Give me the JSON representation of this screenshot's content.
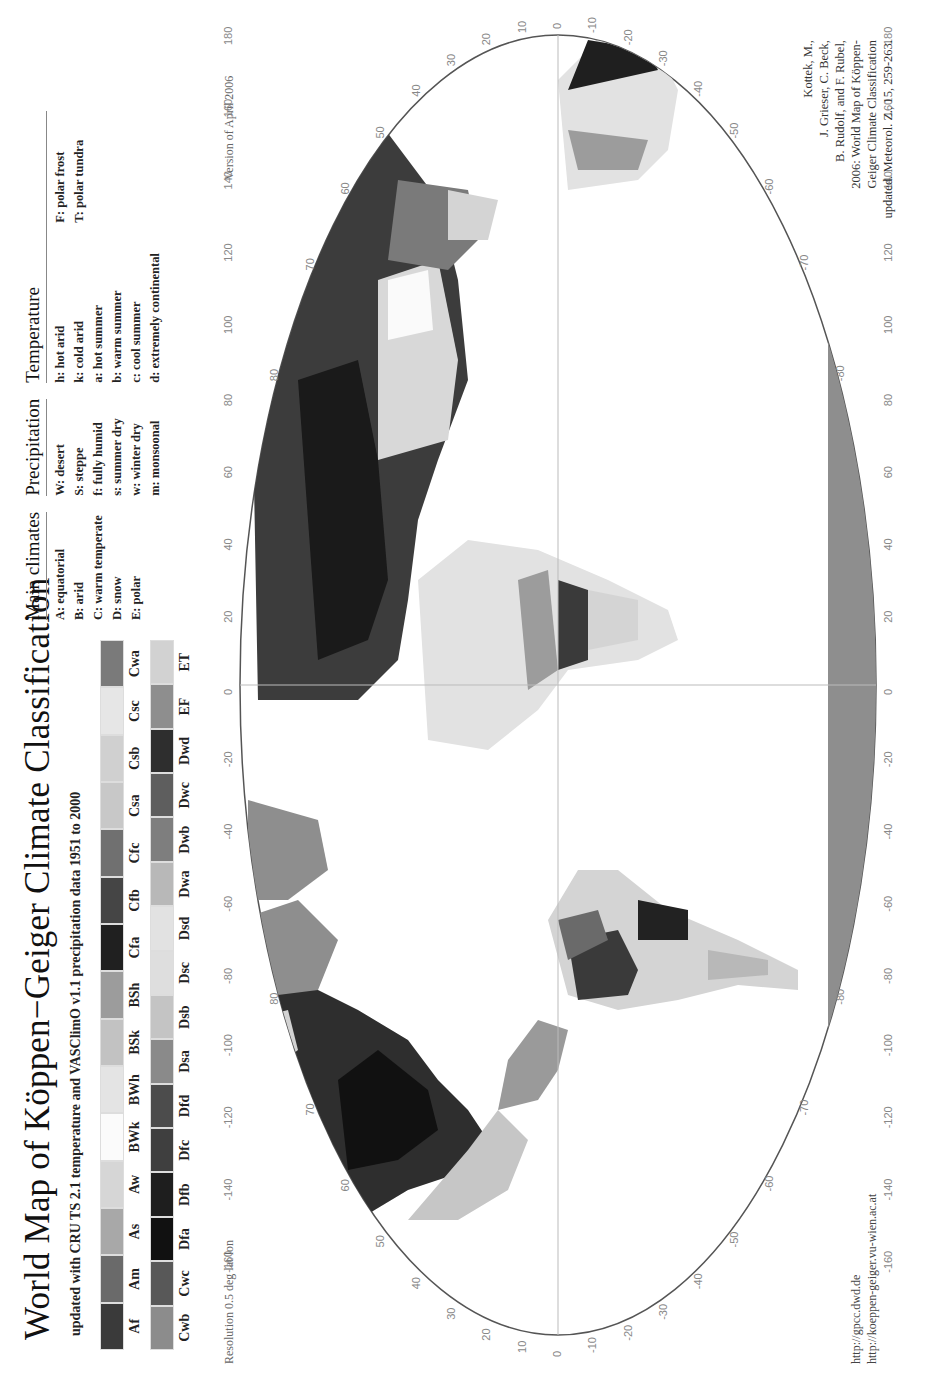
{
  "header": {
    "title": "World Map of Köppen−Geiger Climate Classification",
    "subtitle": "updated with CRU TS 2.1 temperature and VASClimO v1.1 precipitation data 1951 to 2000"
  },
  "legend": {
    "row1": [
      {
        "code": "Af",
        "color": "#3a3a3a"
      },
      {
        "code": "Am",
        "color": "#6a6a6a"
      },
      {
        "code": "As",
        "color": "#a8a8a8"
      },
      {
        "code": "Aw",
        "color": "#d6d6d6"
      },
      {
        "code": "BWk",
        "color": "#fbfbfb"
      },
      {
        "code": "BWh",
        "color": "#e4e4e4"
      },
      {
        "code": "BSk",
        "color": "#c2c2c2"
      },
      {
        "code": "BSh",
        "color": "#9c9c9c"
      },
      {
        "code": "Cfa",
        "color": "#202020"
      },
      {
        "code": "Cfb",
        "color": "#454545"
      },
      {
        "code": "Cfc",
        "color": "#707070"
      },
      {
        "code": "Csa",
        "color": "#c8c8c8"
      },
      {
        "code": "Csb",
        "color": "#d0d0d0"
      },
      {
        "code": "Csc",
        "color": "#e6e6e6"
      },
      {
        "code": "Cwa",
        "color": "#7a7a7a"
      }
    ],
    "row2": [
      {
        "code": "Cwb",
        "color": "#8c8c8c"
      },
      {
        "code": "Cwc",
        "color": "#585858"
      },
      {
        "code": "Dfa",
        "color": "#111111"
      },
      {
        "code": "Dfb",
        "color": "#1e1e1e"
      },
      {
        "code": "Dfc",
        "color": "#3f3f3f"
      },
      {
        "code": "Dfd",
        "color": "#4c4c4c"
      },
      {
        "code": "Dsa",
        "color": "#8a8a8a"
      },
      {
        "code": "Dsb",
        "color": "#c4c4c4"
      },
      {
        "code": "Dsc",
        "color": "#dedede"
      },
      {
        "code": "Dsd",
        "color": "#e2e2e2"
      },
      {
        "code": "Dwa",
        "color": "#b8b8b8"
      },
      {
        "code": "Dwb",
        "color": "#7e7e7e"
      },
      {
        "code": "Dwc",
        "color": "#5e5e5e"
      },
      {
        "code": "Dwd",
        "color": "#2e2e2e"
      },
      {
        "code": "EF",
        "color": "#8e8e8e"
      },
      {
        "code": "ET",
        "color": "#d2d2d2"
      }
    ]
  },
  "definitions": {
    "main": {
      "heading": "Main climates",
      "items": [
        "A: equatorial",
        "B: arid",
        "C: warm temperate",
        "D: snow",
        "E: polar"
      ]
    },
    "precipitation": {
      "heading": "Precipitation",
      "items": [
        "W: desert",
        "S: steppe",
        "f: fully humid",
        "s: summer dry",
        "w: winter dry",
        "m: monsoonal"
      ]
    },
    "temperature": {
      "heading": "Temperature",
      "items": [
        "h: hot arid",
        "k: cold arid",
        "a: hot summer",
        "b: warm summer",
        "c: cool summer",
        "d: extremely continental"
      ],
      "extra": [
        "F: polar frost",
        "T: polar tundra"
      ]
    }
  },
  "map": {
    "version": "Version of April 2006",
    "resolution": "Resolution  0.5 deg lat/lon",
    "lon_ticks": [
      "-160",
      "-140",
      "-120",
      "-100",
      "-80",
      "-60",
      "-40",
      "-20",
      "0",
      "20",
      "40",
      "60",
      "80",
      "100",
      "120",
      "140",
      "160",
      "180"
    ],
    "lat_ticks": [
      "80",
      "70",
      "60",
      "50",
      "40",
      "30",
      "20",
      "10",
      "0",
      "-10",
      "-20",
      "-30",
      "-40",
      "-50",
      "-60",
      "-70",
      "-80"
    ],
    "edge_labels": {
      "left_top": "90",
      "left_bottom": "-90"
    },
    "region_labels": [
      "EF",
      "ET",
      "Dfc",
      "Dfb",
      "Dfa",
      "Cfa",
      "BSk",
      "BWh",
      "Csb",
      "Cfb",
      "Am",
      "Af",
      "Aw",
      "Cfa",
      "BWk",
      "BSh",
      "Csa",
      "Dwc",
      "Dwb",
      "Dfd",
      "BWh",
      "BSh",
      "Aw",
      "Cfb",
      "Cwa",
      "EF"
    ]
  },
  "footer": {
    "urls": [
      "http://gpcc.dwd.de",
      "http://koeppen-geiger.vu-wien.ac.at"
    ],
    "citation": [
      "Kottek, M.,",
      "J. Grieser, C. Beck,",
      "B. Rudolf, and F. Rubel,",
      "2006: World Map of Köppen-",
      "Geiger Climate Classification",
      "updated. Meteorol. Z., 15, 259-263."
    ]
  }
}
